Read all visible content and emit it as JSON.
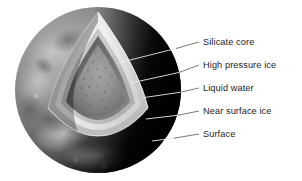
{
  "figure": {
    "kind": "planetary-interior-cutaway",
    "background_color": "#ffffff"
  },
  "sphere": {
    "center_x": 98,
    "center_y": 90,
    "radius": 83,
    "lit_side_color": "#8e8e8e",
    "shadow_side_color": "#0a0a0a"
  },
  "layers": [
    {
      "id": "silicate-core",
      "label": "Silicate core",
      "color": "#8a8a8a",
      "order": 1
    },
    {
      "id": "high-pressure-ice",
      "label": "High pressure ice",
      "color": "#6e6e6e",
      "order": 2
    },
    {
      "id": "liquid-water",
      "label": "Liquid water",
      "color": "#c9c9c9",
      "order": 3
    },
    {
      "id": "near-surface-ice",
      "label": "Near surface ice",
      "color": "#efefef",
      "order": 4
    },
    {
      "id": "surface",
      "label": "Surface",
      "color": "#777777",
      "order": 5
    }
  ],
  "callouts": [
    {
      "id": "callout-silicate-core",
      "label": "Silicate core",
      "text_x": 203,
      "text_y": 45,
      "line_x1": 118,
      "line_y1": 63,
      "line_x2": 199,
      "line_y2": 42
    },
    {
      "id": "callout-high-pressure-ice",
      "label": "High pressure ice",
      "text_x": 203,
      "text_y": 68,
      "line_x1": 130,
      "line_y1": 82,
      "line_x2": 199,
      "line_y2": 65
    },
    {
      "id": "callout-liquid-water",
      "label": "Liquid water",
      "text_x": 203,
      "text_y": 91,
      "line_x1": 140,
      "line_y1": 97,
      "line_x2": 199,
      "line_y2": 88
    },
    {
      "id": "callout-near-surface-ice",
      "label": "Near surface ice",
      "text_x": 203,
      "text_y": 114,
      "line_x1": 146,
      "line_y1": 119,
      "line_x2": 199,
      "line_y2": 111
    },
    {
      "id": "callout-surface",
      "label": "Surface",
      "text_x": 203,
      "text_y": 137,
      "line_x1": 152,
      "line_y1": 140,
      "line_x2": 199,
      "line_y2": 134
    }
  ]
}
